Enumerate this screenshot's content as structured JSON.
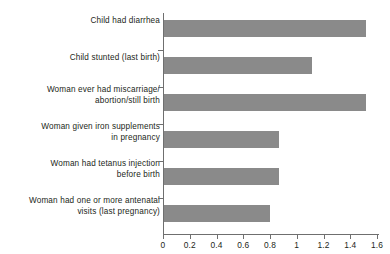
{
  "chart_data": {
    "type": "bar",
    "orientation": "horizontal",
    "title": "",
    "xlabel": "",
    "ylabel": "",
    "xlim": [
      0,
      1.6
    ],
    "xticks": [
      "0",
      "0.2",
      "0.4",
      "0.6",
      "0.8",
      "1",
      "1.2",
      "1.4",
      "1.6"
    ],
    "xtick_values": [
      0,
      0.2,
      0.4,
      0.6,
      0.8,
      1,
      1.2,
      1.4,
      1.6
    ],
    "grid": false,
    "legend": false,
    "bar_color": "#8a8a8a",
    "categories": [
      "Child had diarrhea",
      "Child stunted (last birth)",
      "Woman ever had miscarriage/\nabortion/still birth",
      "Woman given iron supplements\nin pregnancy",
      "Woman had tetanus injection\nbefore birth",
      "Woman had one or more antenatal\nvisits (last pregnancy)"
    ],
    "values": [
      1.51,
      1.11,
      1.51,
      0.86,
      0.86,
      0.79
    ]
  }
}
